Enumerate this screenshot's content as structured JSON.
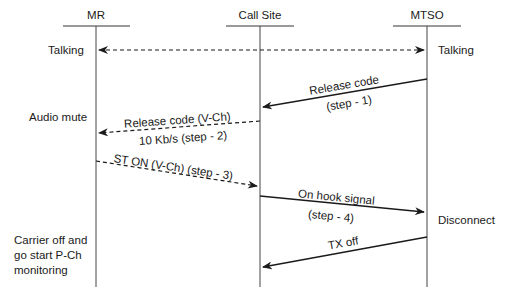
{
  "lifelines": [
    {
      "id": "mr",
      "label": "MR"
    },
    {
      "id": "callsite",
      "label": "Call Site"
    },
    {
      "id": "mtso",
      "label": "MTSO"
    }
  ],
  "notes": {
    "mr_talking": "Talking",
    "mtso_talking": "Talking",
    "audio_mute": "Audio mute",
    "disconnect": "Disconnect",
    "carrier_off_1": "Carrier off and",
    "carrier_off_2": "go start P-Ch",
    "carrier_off_3": "monitoring"
  },
  "messages": [
    {
      "id": "talking",
      "from": "MR",
      "to": "MTSO",
      "style": "dashed",
      "bidirectional": true
    },
    {
      "id": "step1",
      "from": "MTSO",
      "to": "Call Site",
      "style": "solid",
      "label_top": "Release code",
      "label_bottom": "(step - 1)"
    },
    {
      "id": "step2",
      "from": "Call Site",
      "to": "MR",
      "style": "dashed",
      "label_top": "Release code (V-Ch)",
      "label_bottom": "10 Kb/s (step - 2)"
    },
    {
      "id": "step3",
      "from": "MR",
      "to": "Call Site",
      "style": "dashed",
      "label_top": "ST ON (V-Ch) (step - 3)"
    },
    {
      "id": "step4",
      "from": "Call Site",
      "to": "MTSO",
      "style": "solid",
      "label_top": "On hook signal",
      "label_bottom": "(step - 4)"
    },
    {
      "id": "txoff",
      "from": "MTSO",
      "to": "MR",
      "style": "solid",
      "label_top": "TX off"
    }
  ]
}
